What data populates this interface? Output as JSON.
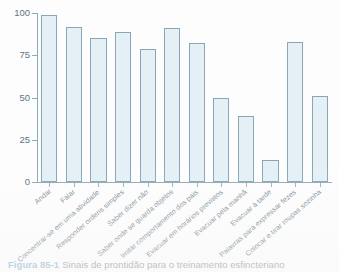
{
  "figure": {
    "number": "Figura 85-1",
    "caption": "Sinais de prontidão para o treinamento esfincteriano"
  },
  "chart_data": {
    "type": "bar",
    "title": "",
    "xlabel": "",
    "ylabel": "",
    "ylim": [
      0,
      100
    ],
    "yticks": [
      0,
      25,
      50,
      75,
      100
    ],
    "ytick_labels": [
      "0",
      "25",
      "50",
      "75",
      "100"
    ],
    "grid": false,
    "legend": "none",
    "bar_color": "#e4f0f6",
    "bar_border_color": "#89a6b6",
    "axis_color": "#8fa9b8",
    "label_color": "#7d8d97",
    "categories": [
      "Andar",
      "Falar",
      "Concentrar-se em uma atividade",
      "Responder ordens simples",
      "Saber dizer não",
      "Saber onde se guarda objetos",
      "Imitar comportamento dos pais",
      "Evacuar em horários previstos",
      "Evacuar pela manhã",
      "Evacuar à tarde",
      "Palavras para expressar fezes",
      "Colocar e tirar roupas sozinha"
    ],
    "values": [
      99,
      92,
      85,
      89,
      79,
      91,
      82,
      50,
      39,
      13,
      83,
      51
    ]
  }
}
